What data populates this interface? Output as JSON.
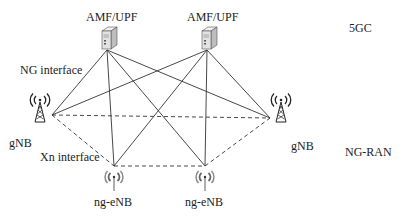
{
  "diagram": {
    "layers": {
      "core": "5GC",
      "ran": "NG-RAN"
    },
    "interfaces": {
      "ng": "NG interface",
      "xn": "Xn interface"
    },
    "nodes": [
      {
        "id": "amf1",
        "label": "AMF/UPF",
        "type": "server"
      },
      {
        "id": "amf2",
        "label": "AMF/UPF",
        "type": "server"
      },
      {
        "id": "gnb_left",
        "label": "gNB",
        "type": "tower"
      },
      {
        "id": "gnb_right",
        "label": "gNB",
        "type": "tower"
      },
      {
        "id": "ngenb_left",
        "label": "ng-eNB",
        "type": "antenna"
      },
      {
        "id": "ngenb_right",
        "label": "ng-eNB",
        "type": "antenna"
      }
    ],
    "edges_ng": [
      [
        "amf1",
        "gnb_left"
      ],
      [
        "amf1",
        "gnb_right"
      ],
      [
        "amf1",
        "ngenb_left"
      ],
      [
        "amf1",
        "ngenb_right"
      ],
      [
        "amf2",
        "gnb_left"
      ],
      [
        "amf2",
        "gnb_right"
      ],
      [
        "amf2",
        "ngenb_left"
      ],
      [
        "amf2",
        "ngenb_right"
      ]
    ],
    "edges_xn": [
      [
        "gnb_left",
        "gnb_right"
      ],
      [
        "gnb_left",
        "ngenb_left"
      ],
      [
        "ngenb_left",
        "ngenb_right"
      ],
      [
        "ngenb_right",
        "gnb_right"
      ]
    ],
    "colors": {
      "line": "#333333",
      "text": "#222222"
    }
  }
}
